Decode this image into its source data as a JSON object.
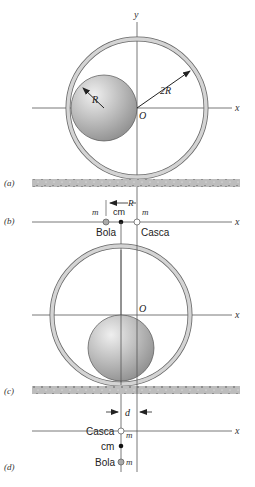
{
  "panels": {
    "a": {
      "label": "(a)",
      "axis_x": "x",
      "axis_y": "y",
      "origin": "O",
      "ball_radius_label": "R",
      "shell_radius_label": "2R"
    },
    "b": {
      "label": "(b)",
      "axis_x": "x",
      "separation_label": "R",
      "mass_left": "m",
      "mass_right": "m",
      "cm_label": "cm",
      "ball_label": "Bola",
      "shell_label": "Casca"
    },
    "c": {
      "label": "(c)",
      "axis_x": "x",
      "origin": "O"
    },
    "d": {
      "label": "(d)",
      "axis_x": "x",
      "distance_label": "d",
      "shell_label": "Casca",
      "cm_label": "cm",
      "ball_label": "Bola",
      "mass_shell": "m",
      "mass_ball": "m"
    }
  },
  "colors": {
    "line": "#555555",
    "shell_fill": "#d0d0d0",
    "ground": "#b8b8b8",
    "ball_light": "#e8e8e8",
    "ball_dark": "#8c8c8c"
  }
}
